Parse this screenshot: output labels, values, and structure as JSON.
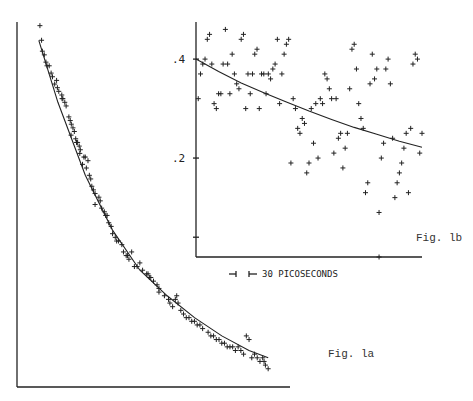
{
  "chart_data": [
    {
      "type": "scatter",
      "id": "fig1a",
      "title": "Fig. la",
      "xlabel": "",
      "ylabel": "",
      "xlim": [
        0,
        100
      ],
      "ylim": [
        0,
        100
      ],
      "grid": false,
      "fit_curve": {
        "x": [
          8,
          15,
          25,
          35,
          45,
          55,
          65,
          75,
          85,
          92
        ],
        "y": [
          95,
          78,
          58,
          43,
          32,
          25,
          19,
          14,
          10,
          8
        ]
      },
      "points": {
        "x": [
          8.4,
          9,
          9.3,
          10,
          10.6,
          11,
          12.5,
          11.8,
          13,
          13.8,
          14.8,
          15.3,
          14.5,
          16.4,
          16.8,
          17.5,
          16.5,
          18,
          19,
          19.5,
          19.9,
          20.5,
          21,
          19.8,
          21.5,
          22.2,
          22.8,
          21.8,
          23.2,
          23,
          24.5,
          26,
          25.4,
          26.5,
          27,
          25,
          24,
          27.4,
          28,
          28.6,
          30,
          30.5,
          28.6,
          31,
          32,
          32.5,
          33.6,
          34.5,
          35,
          33,
          36,
          37.2,
          38.4,
          36.5,
          39,
          40,
          41,
          40.5,
          43,
          45,
          42,
          44,
          46,
          47.5,
          48.5,
          48,
          50,
          51.3,
          52,
          49,
          52,
          54,
          55.5,
          56,
          57,
          58,
          59,
          60,
          61,
          62,
          58.5,
          63,
          64,
          65,
          66,
          67,
          68,
          70,
          71,
          72,
          73,
          74,
          75,
          76,
          77,
          78,
          79,
          80,
          81,
          82,
          83,
          84,
          85,
          86,
          87,
          88,
          89,
          90,
          90.5,
          91,
          92
        ],
        "y": [
          99,
          95,
          92,
          91,
          89,
          88,
          86,
          88,
          85,
          83,
          82,
          81,
          84,
          80,
          79,
          78,
          79,
          77,
          74,
          73,
          72,
          71,
          70,
          69,
          68,
          67,
          66,
          67,
          65,
          64,
          63,
          62,
          60,
          58,
          57,
          63,
          61,
          55,
          54,
          53,
          52,
          51,
          50,
          49,
          48,
          47,
          45,
          44,
          42,
          47,
          41,
          40,
          39,
          40,
          37,
          36,
          35,
          36,
          33,
          34,
          37,
          33,
          32,
          31,
          30,
          31,
          29,
          28,
          27,
          30,
          26,
          25,
          24,
          23,
          22,
          24,
          23,
          21,
          20,
          19,
          25,
          19,
          18,
          18,
          17,
          17,
          16,
          15,
          14,
          14,
          13,
          13,
          12,
          12,
          11,
          11,
          11,
          10,
          11,
          10,
          9,
          14,
          13,
          8,
          9,
          8,
          7,
          8,
          7,
          6,
          5,
          5
        ]
      }
    },
    {
      "type": "scatter",
      "id": "fig1b",
      "title": "Fig. lb",
      "xlabel": "",
      "ylabel": "",
      "xlim": [
        0,
        100
      ],
      "ylim": [
        0,
        0.475
      ],
      "yticks": [
        {
          "value": 0.4,
          "label": ".4"
        },
        {
          "value": 0.2,
          "label": ".2"
        },
        {
          "value": 0.04,
          "label": ""
        }
      ],
      "grid": false,
      "scale_bar": {
        "label": "30 PICOSECONDS",
        "value_ps": 30
      },
      "fit_curve": {
        "x": [
          0,
          10,
          20,
          30,
          40,
          50,
          60,
          70,
          80,
          90,
          100
        ],
        "y": [
          0.4,
          0.375,
          0.352,
          0.332,
          0.313,
          0.295,
          0.278,
          0.262,
          0.248,
          0.234,
          0.222
        ]
      },
      "points": {
        "x": [
          1,
          2,
          3,
          4,
          5,
          6,
          7,
          8,
          9,
          10,
          11,
          12,
          13,
          14,
          15,
          16,
          17,
          18,
          19,
          20,
          21,
          22,
          23,
          24,
          25,
          26,
          27,
          28,
          29,
          30,
          31,
          32,
          33,
          34,
          35,
          36,
          37,
          38,
          39,
          40,
          41,
          42,
          43,
          44,
          45,
          46,
          47,
          48,
          49,
          50,
          51,
          52,
          53,
          54,
          55,
          56,
          57,
          58,
          59,
          60,
          61,
          62,
          63,
          64,
          65,
          66,
          67,
          68,
          69,
          70,
          71,
          72,
          73,
          74,
          75,
          76,
          77,
          78,
          79,
          80,
          81,
          82,
          83,
          84,
          85,
          86,
          87,
          88,
          89,
          90,
          91,
          92,
          93,
          94,
          95,
          96,
          97,
          98,
          99,
          100,
          81
        ],
        "y": [
          0.32,
          0.37,
          0.39,
          0.4,
          0.44,
          0.45,
          0.39,
          0.31,
          0.3,
          0.33,
          0.33,
          0.39,
          0.46,
          0.39,
          0.33,
          0.41,
          0.37,
          0.35,
          0.34,
          0.44,
          0.45,
          0.3,
          0.37,
          0.33,
          0.37,
          0.41,
          0.42,
          0.3,
          0.37,
          0.37,
          0.33,
          0.37,
          0.36,
          0.38,
          0.39,
          0.44,
          0.31,
          0.37,
          0.41,
          0.43,
          0.44,
          0.19,
          0.32,
          0.3,
          0.26,
          0.25,
          0.28,
          0.27,
          0.17,
          0.19,
          0.3,
          0.23,
          0.31,
          0.2,
          0.32,
          0.31,
          0.37,
          0.36,
          0.34,
          0.32,
          0.21,
          0.32,
          0.24,
          0.25,
          0.18,
          0.22,
          0.25,
          0.34,
          0.42,
          0.43,
          0.38,
          0.31,
          0.28,
          0.26,
          0.13,
          0.15,
          0.35,
          0.41,
          0.36,
          0.38,
          0.09,
          0.2,
          0.23,
          0.38,
          0.4,
          0.35,
          0.24,
          0.12,
          0.15,
          0.17,
          0.19,
          0.22,
          0.25,
          0.13,
          0.26,
          0.39,
          0.41,
          0.4,
          0.21,
          0.25,
          0.0
        ]
      }
    }
  ],
  "labels": {
    "fig1a": "Fig. la",
    "fig1b": "Fig. lb",
    "scale": "30 PICOSECONDS",
    "tick_04": ".4",
    "tick_02": ".2"
  }
}
